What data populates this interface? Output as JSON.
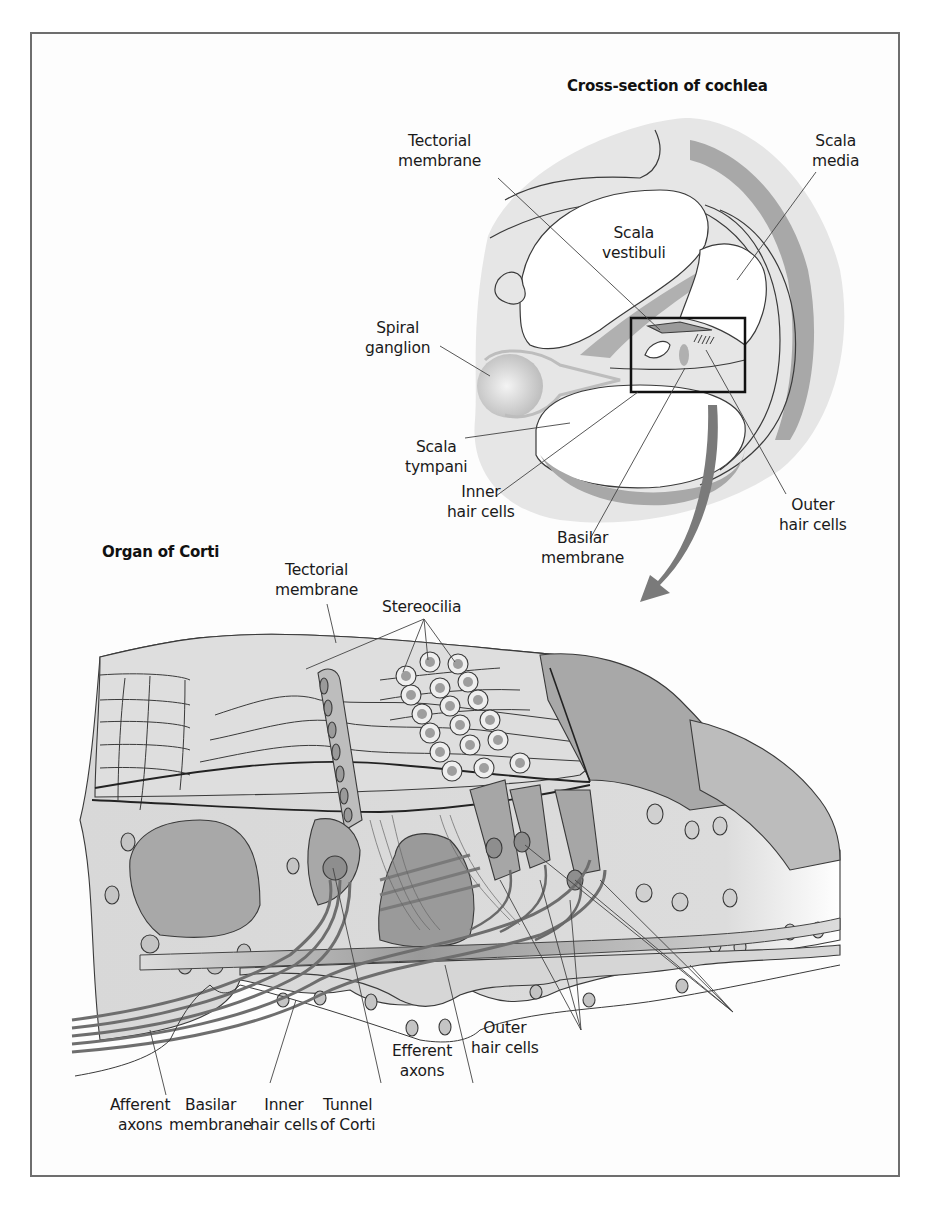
{
  "figure": {
    "top_panel": {
      "title": "Cross-section of cochlea",
      "labels": {
        "tectorial_membrane": "Tectorial\nmembrane",
        "scala_media": "Scala\nmedia",
        "scala_vestibuli": "Scala\nvestibuli",
        "spiral_ganglion": "Spiral\nganglion",
        "scala_tympani": "Scala\ntympani",
        "inner_hair_cells": "Inner\nhair cells",
        "basilar_membrane": "Basilar\nmembrane",
        "outer_hair_cells": "Outer\nhair cells"
      }
    },
    "bottom_panel": {
      "title": "Organ of Corti",
      "labels": {
        "tectorial_membrane": "Tectorial\nmembrane",
        "stereocilia": "Stereocilia",
        "afferent_axons": "Afferent\naxons",
        "basilar_membrane": "Basilar\nmembrane",
        "inner_hair_cells": "Inner\nhair cells",
        "tunnel_of_corti": "Tunnel\nof Corti",
        "efferent_axons": "Efferent\naxons",
        "outer_hair_cells": "Outer\nhair cells"
      }
    },
    "colors": {
      "light_tissue": "#e4e4e4",
      "mid_tissue": "#bdbdbd",
      "dark_tissue": "#9a9a9a",
      "nerve": "#7d7d7d",
      "outline": "#3a3a3a",
      "frame": "#6e6e6e"
    }
  }
}
